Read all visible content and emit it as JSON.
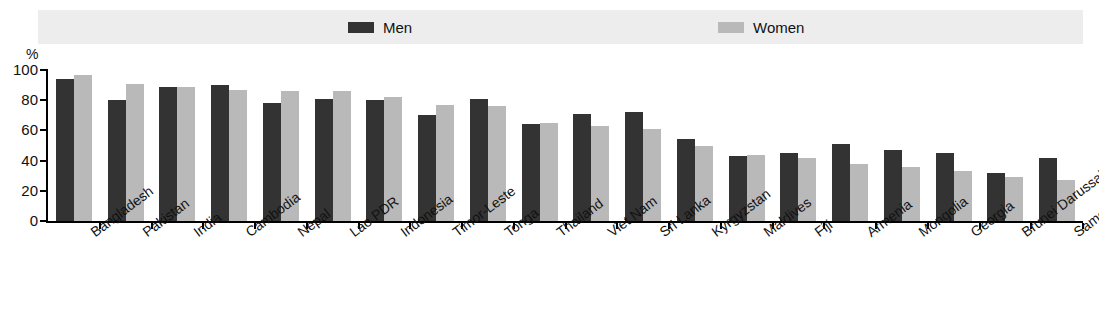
{
  "legend": {
    "men": {
      "label": "Men",
      "color": "#333333"
    },
    "women": {
      "label": "Women",
      "color": "#b9b9b9"
    }
  },
  "axis": {
    "unit": "%",
    "yticks": [
      "100",
      "80",
      "60",
      "40",
      "20",
      "0"
    ]
  },
  "chart_data": {
    "type": "bar",
    "title": "",
    "subtitle": "",
    "xlabel": "",
    "ylabel": "%",
    "ylim": [
      0,
      100
    ],
    "ytick_values": [
      0,
      20,
      40,
      60,
      80,
      100
    ],
    "grid": false,
    "legend_position": "top",
    "categories": [
      "Bangladesh",
      "Pakistan",
      "India",
      "Cambodia",
      "Nepal",
      "Lao PDR",
      "Indonesia",
      "Timor-Leste",
      "Tonga",
      "Thailand",
      "Viet Nam",
      "Sri Lanka",
      "Kyrgyzstan",
      "Maldives",
      "Fiji",
      "Armenia",
      "Mongolia",
      "Georgia",
      "Brunei Darussalam",
      "Samoa"
    ],
    "series": [
      {
        "name": "Men",
        "color": "#333333",
        "values": [
          94,
          80,
          89,
          90,
          78,
          81,
          80,
          70,
          81,
          64,
          71,
          72,
          54,
          43,
          45,
          51,
          47,
          45,
          32,
          42
        ]
      },
      {
        "name": "Women",
        "color": "#b9b9b9",
        "values": [
          97,
          91,
          89,
          87,
          86,
          86,
          82,
          77,
          76,
          65,
          63,
          61,
          50,
          44,
          42,
          38,
          36,
          33,
          29,
          27
        ]
      }
    ]
  }
}
